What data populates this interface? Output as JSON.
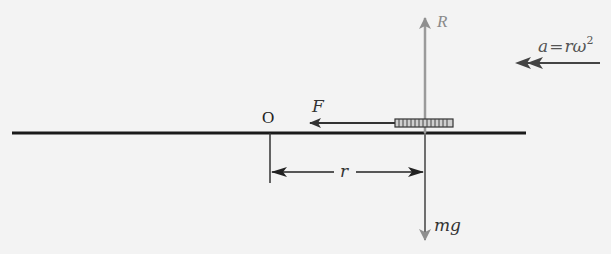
{
  "diagram": {
    "labels": {
      "reaction": "R",
      "acceleration_a": "a",
      "acceleration_eq": "=",
      "acceleration_r": "r",
      "acceleration_omega": "ω",
      "acceleration_exp": "2",
      "origin": "O",
      "friction": "F",
      "radius": "r",
      "weight": "mg"
    },
    "colors": {
      "background": "#f3f3f3",
      "line": "#1a1a1a",
      "axis": "#9a9a9a",
      "arrow": "#333333"
    }
  }
}
